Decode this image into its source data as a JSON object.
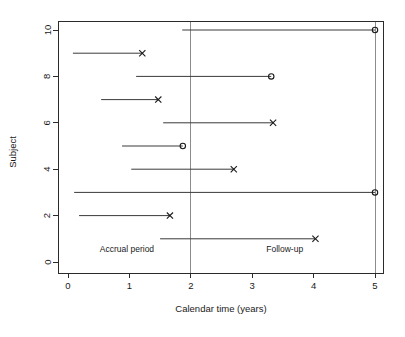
{
  "chart_data": {
    "type": "line",
    "title": "",
    "xlabel": "Calendar time (years)",
    "ylabel": "Subject",
    "xlim": [
      -0.15,
      5.25
    ],
    "ylim": [
      -0.35,
      10.45
    ],
    "xticks": [
      0,
      1,
      2,
      3,
      4,
      5
    ],
    "xtick_labels": [
      "0",
      "1",
      "2",
      "3",
      "4",
      "5"
    ],
    "yticks": [
      0,
      2,
      4,
      6,
      8,
      10
    ],
    "ytick_labels": [
      "0",
      "2",
      "4",
      "6",
      "8",
      "10"
    ],
    "grid": false,
    "legend": null,
    "annotations": [
      {
        "text": "Accrual period",
        "x": 0.96,
        "y": 0.45
      },
      {
        "text": "Follow-up",
        "x": 3.53,
        "y": 0.45
      }
    ],
    "reference_lines": [
      {
        "x": 2.0,
        "label": "end-of-accrual",
        "style": "solid"
      },
      {
        "x": 5.0,
        "label": "end-of-study",
        "style": "solid"
      }
    ],
    "marker_legend": {
      "x": "event (death / failure)",
      "o": "censored"
    },
    "series": [
      {
        "subject": 10,
        "entry": 1.86,
        "exit": 5.0,
        "marker": "o"
      },
      {
        "subject": 9,
        "entry": 0.08,
        "exit": 1.21,
        "marker": "x"
      },
      {
        "subject": 8,
        "entry": 1.11,
        "exit": 3.31,
        "marker": "o"
      },
      {
        "subject": 7,
        "entry": 0.54,
        "exit": 1.47,
        "marker": "x"
      },
      {
        "subject": 6,
        "entry": 1.55,
        "exit": 3.34,
        "marker": "x"
      },
      {
        "subject": 5,
        "entry": 0.88,
        "exit": 1.87,
        "marker": "o"
      },
      {
        "subject": 4,
        "entry": 1.03,
        "exit": 2.7,
        "marker": "x"
      },
      {
        "subject": 3,
        "entry": 0.1,
        "exit": 5.0,
        "marker": "o"
      },
      {
        "subject": 2,
        "entry": 0.18,
        "exit": 1.66,
        "marker": "x"
      },
      {
        "subject": 1,
        "entry": 1.5,
        "exit": 4.03,
        "marker": "x"
      }
    ]
  }
}
